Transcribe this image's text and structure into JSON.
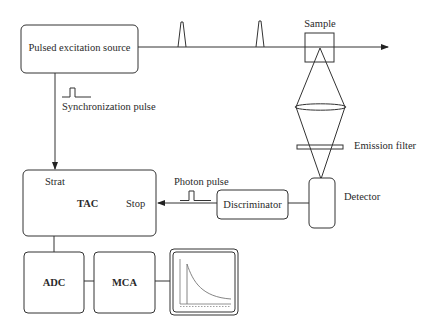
{
  "diagram": {
    "nodes": {
      "source": "Pulsed excitation source",
      "sample": "Sample",
      "emission_filter": "Emission filter",
      "detector": "Detector",
      "discriminator": "Discriminator",
      "tac": "TAC",
      "tac_start": "Strat",
      "tac_stop": "Stop",
      "adc": "ADC",
      "mca": "MCA"
    },
    "annotations": {
      "sync_pulse": "Synchronization pulse",
      "photon_pulse": "Photon pulse"
    },
    "icons": {
      "display": "decay-curve-display-icon",
      "excitation_pulse": "pulse-peak-icon",
      "square_pulse": "square-pulse-icon",
      "lens": "lens-icon"
    },
    "colors": {
      "line": "#333333",
      "text": "#2a2a2a",
      "background": "#ffffff"
    }
  }
}
